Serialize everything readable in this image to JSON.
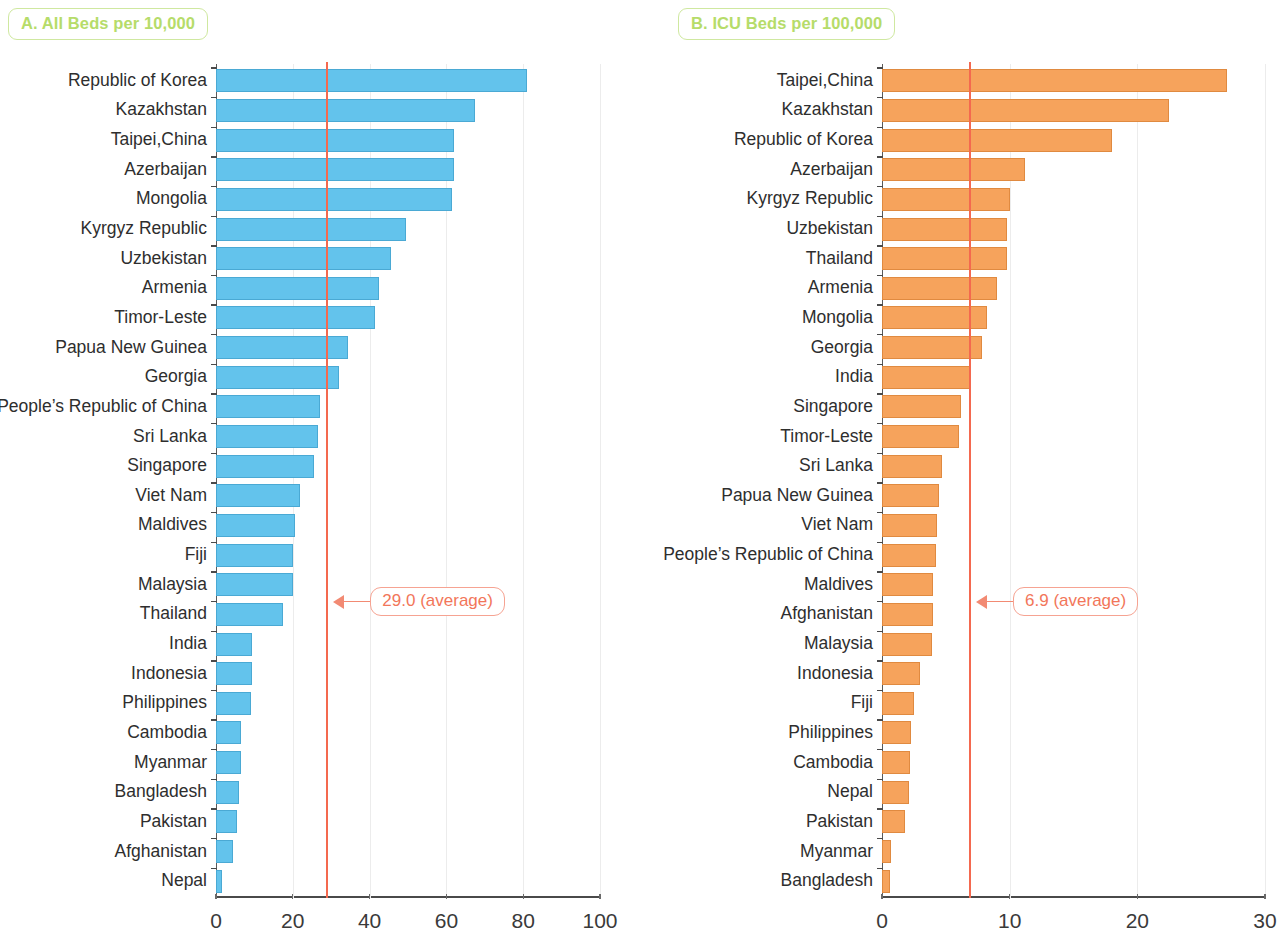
{
  "chart_data": [
    {
      "type": "bar",
      "panel": "A",
      "title": "A. All Beds per 10,000",
      "orientation": "horizontal",
      "xlabel": "",
      "ylabel": "",
      "xlim": [
        0,
        100
      ],
      "xticks": [
        "0",
        "20",
        "40",
        "60",
        "80",
        "100"
      ],
      "grid": true,
      "bar_color": "#63c3ec",
      "average_line": {
        "value": 29.0,
        "label": "29.0 (average)",
        "color": "#f4694f"
      },
      "categories": [
        "Republic of Korea",
        "Kazakhstan",
        "Taipei,China",
        "Azerbaijan",
        "Mongolia",
        "Kyrgyz Republic",
        "Uzbekistan",
        "Armenia",
        "Timor-Leste",
        "Papua New Guinea",
        "Georgia",
        "People’s Republic of China",
        "Sri Lanka",
        "Singapore",
        "Viet Nam",
        "Maldives",
        "Fiji",
        "Malaysia",
        "Thailand",
        "India",
        "Indonesia",
        "Philippines",
        "Cambodia",
        "Myanmar",
        "Bangladesh",
        "Pakistan",
        "Afghanistan",
        "Nepal"
      ],
      "values": [
        81.0,
        67.5,
        62.0,
        62.0,
        61.5,
        49.5,
        45.5,
        42.5,
        41.5,
        34.5,
        32.0,
        27.0,
        26.5,
        25.5,
        22.0,
        20.5,
        20.0,
        20.0,
        17.5,
        9.5,
        9.5,
        9.0,
        6.5,
        6.5,
        6.0,
        5.5,
        4.5,
        1.5
      ]
    },
    {
      "type": "bar",
      "panel": "B",
      "title": "B. ICU Beds per 100,000",
      "orientation": "horizontal",
      "xlabel": "",
      "ylabel": "",
      "xlim": [
        0,
        30
      ],
      "xticks": [
        "0",
        "10",
        "20",
        "30"
      ],
      "grid": true,
      "bar_color": "#f6a35c",
      "average_line": {
        "value": 6.9,
        "label": "6.9 (average)",
        "color": "#f4694f"
      },
      "categories": [
        "Taipei,China",
        "Kazakhstan",
        "Republic of Korea",
        "Azerbaijan",
        "Kyrgyz Republic",
        "Uzbekistan",
        "Thailand",
        "Armenia",
        "Mongolia",
        "Georgia",
        "India",
        "Singapore",
        "Timor-Leste",
        "Sri Lanka",
        "Papua New Guinea",
        "Viet Nam",
        "People’s Republic of China",
        "Maldives",
        "Afghanistan",
        "Malaysia",
        "Indonesia",
        "Fiji",
        "Philippines",
        "Cambodia",
        "Nepal",
        "Pakistan",
        "Myanmar",
        "Bangladesh"
      ],
      "values": [
        27.0,
        22.5,
        18.0,
        11.2,
        10.0,
        9.8,
        9.8,
        9.0,
        8.2,
        7.8,
        7.0,
        6.2,
        6.0,
        4.7,
        4.5,
        4.3,
        4.2,
        4.0,
        4.0,
        3.9,
        3.0,
        2.5,
        2.3,
        2.2,
        2.1,
        1.8,
        0.7,
        0.6
      ]
    }
  ]
}
